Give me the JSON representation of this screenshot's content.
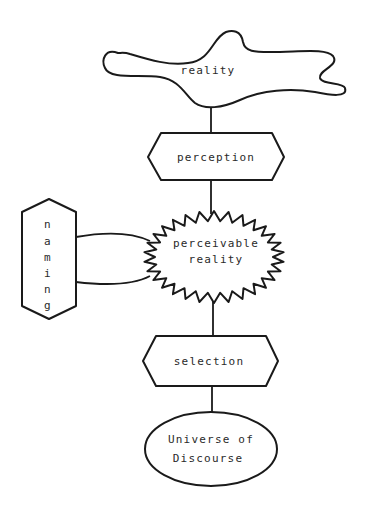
{
  "diagram": {
    "type": "flowchart",
    "colors": {
      "stroke": "#1a1a1a",
      "text": "#2a2a2a",
      "background": "#ffffff"
    },
    "nodes": [
      {
        "id": "reality",
        "shape": "blob",
        "label": "reality"
      },
      {
        "id": "perception",
        "shape": "hexagon",
        "label": "perception"
      },
      {
        "id": "perceivable_reality",
        "shape": "starburst",
        "label_lines": [
          "perceivable",
          "reality"
        ]
      },
      {
        "id": "naming",
        "shape": "vertical-hexagon",
        "letters": [
          "n",
          "a",
          "m",
          "i",
          "n",
          "g"
        ]
      },
      {
        "id": "selection",
        "shape": "hexagon",
        "label": "selection"
      },
      {
        "id": "universe_of_discourse",
        "shape": "ellipse",
        "label_lines": [
          "Universe of",
          "Discourse"
        ]
      }
    ],
    "edges": [
      {
        "from": "reality",
        "to": "perception"
      },
      {
        "from": "perception",
        "to": "perceivable_reality"
      },
      {
        "from": "naming",
        "to": "perceivable_reality",
        "kind": "double-arc"
      },
      {
        "from": "perceivable_reality",
        "to": "selection"
      },
      {
        "from": "selection",
        "to": "universe_of_discourse"
      }
    ]
  }
}
